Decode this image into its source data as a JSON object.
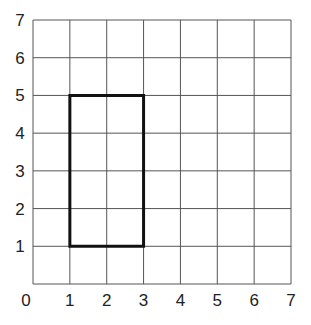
{
  "grid": {
    "x_min": 0,
    "x_max": 7,
    "y_min": 0,
    "y_max": 7,
    "x_labels": [
      "0",
      "1",
      "2",
      "3",
      "4",
      "5",
      "6",
      "7"
    ],
    "y_labels": [
      "1",
      "2",
      "3",
      "4",
      "5",
      "6",
      "7"
    ],
    "line_color": "#555555"
  },
  "rectangle": {
    "vertices": [
      [
        1,
        1
      ],
      [
        3,
        1
      ],
      [
        3,
        5
      ],
      [
        1,
        5
      ]
    ],
    "stroke_color": "#111111",
    "width": 2,
    "height": 4
  }
}
